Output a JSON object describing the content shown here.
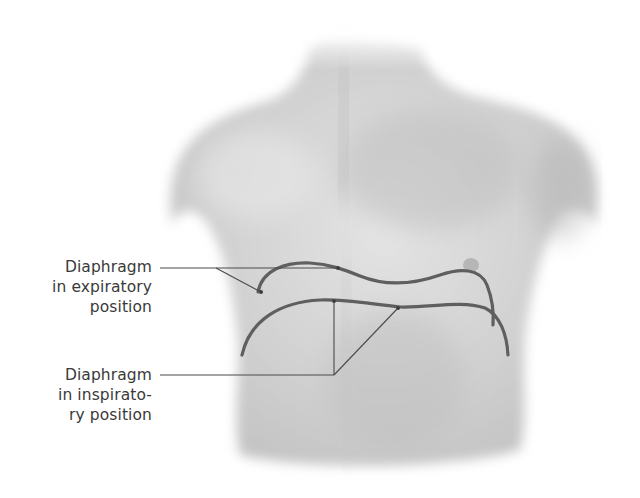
{
  "figure": {
    "colors": {
      "background": "#ffffff",
      "skin_shadow": "#bdbdbd",
      "diaphragm_line": "#5e5e5e",
      "leader_line": "#4a4a4a",
      "label_text": "#3a3a3a"
    }
  },
  "labels": {
    "expiratory": {
      "line1": "Diaphragm",
      "line2": "in expiratory",
      "line3": "position"
    },
    "inspiratory": {
      "line1": "Diaphragm",
      "line2": "in inspirato-",
      "line3": "ry position"
    }
  }
}
